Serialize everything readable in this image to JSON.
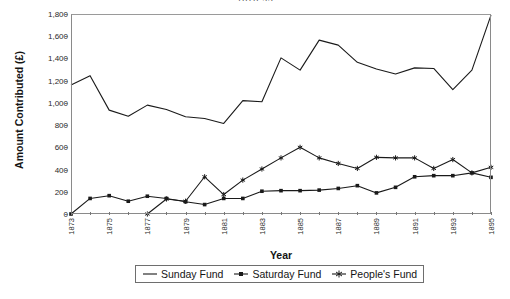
{
  "chart_data": {
    "type": "line",
    "title": "1873-95",
    "xlabel": "Year",
    "ylabel": "Amount Contributed (£)",
    "xlim": [
      1873,
      1895
    ],
    "ylim": [
      0,
      1800
    ],
    "ytick_step": 200,
    "grid": false,
    "legend_position": "bottom",
    "x": [
      1873,
      1874,
      1875,
      1876,
      1877,
      1878,
      1879,
      1880,
      1881,
      1882,
      1883,
      1884,
      1885,
      1886,
      1887,
      1888,
      1889,
      1890,
      1891,
      1892,
      1893,
      1894,
      1895
    ],
    "ytick_labels": [
      "0",
      "200",
      "400",
      "600",
      "800",
      "1,000",
      "1,200",
      "1,400",
      "1,600",
      "1,800"
    ],
    "ytick_values": [
      0,
      200,
      400,
      600,
      800,
      1000,
      1200,
      1400,
      1600,
      1800
    ],
    "xtick_labels": [
      "1873",
      "1875",
      "1877",
      "1879",
      "1881",
      "1883",
      "1885",
      "1887",
      "1889",
      "1891",
      "1893",
      "1895"
    ],
    "xtick_values": [
      1873,
      1875,
      1877,
      1879,
      1881,
      1883,
      1885,
      1887,
      1889,
      1891,
      1893,
      1895
    ],
    "series": [
      {
        "name": "Sunday Fund",
        "marker": "none",
        "color": "#1a1a1a",
        "values": [
          1160,
          1245,
          935,
          880,
          980,
          940,
          875,
          860,
          815,
          1020,
          1010,
          1405,
          1295,
          1565,
          1520,
          1365,
          1305,
          1260,
          1315,
          1310,
          1120,
          1295,
          1790
        ]
      },
      {
        "name": "Saturday Fund",
        "marker": "square",
        "color": "#1a1a1a",
        "values": [
          0,
          140,
          165,
          115,
          160,
          140,
          110,
          85,
          140,
          140,
          205,
          210,
          210,
          215,
          230,
          255,
          190,
          240,
          335,
          345,
          345,
          370,
          330
        ]
      },
      {
        "name": "People's Fund",
        "marker": "star",
        "color": "#1a1a1a",
        "values": [
          null,
          null,
          null,
          null,
          0,
          135,
          115,
          335,
          175,
          305,
          405,
          505,
          600,
          505,
          455,
          410,
          510,
          505,
          505,
          410,
          490,
          370,
          420
        ]
      }
    ]
  },
  "legend": {
    "items": [
      {
        "label": "Sunday Fund",
        "marker": "line"
      },
      {
        "label": "Saturday Fund",
        "marker": "square"
      },
      {
        "label": "People's Fund",
        "marker": "star"
      }
    ]
  }
}
